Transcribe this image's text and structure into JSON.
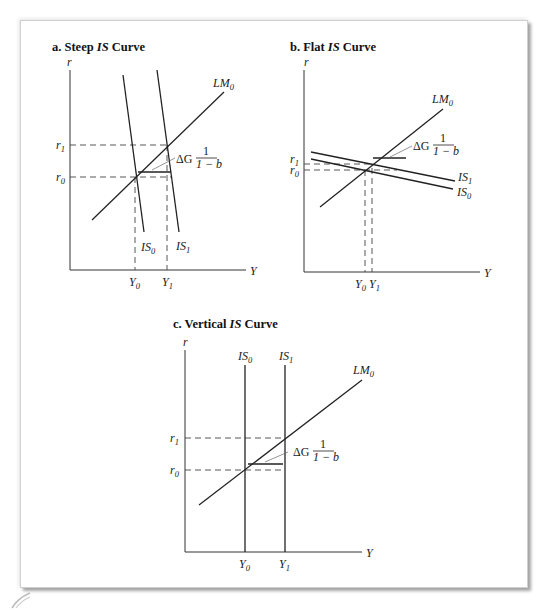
{
  "figure": {
    "panels": [
      {
        "id": "a",
        "title_prefix": "a.  Steep ",
        "title_italic": "IS",
        "title_suffix": " Curve",
        "y_axis_label": "r",
        "x_axis_label": "Y",
        "lm_label": "LM",
        "lm_sub": "0",
        "is0_label": "IS",
        "is0_sub": "0",
        "is1_label": "IS",
        "is1_sub": "1",
        "r1_label": "r",
        "r1_sub": "1",
        "r0_label": "r",
        "r0_sub": "0",
        "y0_label": "Y",
        "y0_sub": "0",
        "y1_label": "Y",
        "y1_sub": "1",
        "shift_label_delta": "ΔG",
        "shift_num": "1",
        "shift_den": "1 − b"
      },
      {
        "id": "b",
        "title_prefix": "b.  Flat ",
        "title_italic": "IS",
        "title_suffix": " Curve",
        "y_axis_label": "r",
        "x_axis_label": "Y",
        "lm_label": "LM",
        "lm_sub": "0",
        "is0_label": "IS",
        "is0_sub": "0",
        "is1_label": "IS",
        "is1_sub": "1",
        "r1_label": "r",
        "r1_sub": "1",
        "r0_label": "r",
        "r0_sub": "0",
        "y0_label": "Y",
        "y0_sub": "0",
        "y1_label": "Y",
        "y1_sub": "1",
        "shift_label_delta": "ΔG",
        "shift_num": "1",
        "shift_den": "1 − b"
      },
      {
        "id": "c",
        "title_prefix": "c.  Vertical ",
        "title_italic": "IS",
        "title_suffix": " Curve",
        "y_axis_label": "r",
        "x_axis_label": "Y",
        "lm_label": "LM",
        "lm_sub": "0",
        "is0_label": "IS",
        "is0_sub": "0",
        "is1_label": "IS",
        "is1_sub": "1",
        "r1_label": "r",
        "r1_sub": "1",
        "r0_label": "r",
        "r0_sub": "0",
        "y0_label": "Y",
        "y0_sub": "0",
        "y1_label": "Y",
        "y1_sub": "1",
        "shift_label_delta": "ΔG",
        "shift_num": "1",
        "shift_den": "1 − b"
      }
    ]
  }
}
